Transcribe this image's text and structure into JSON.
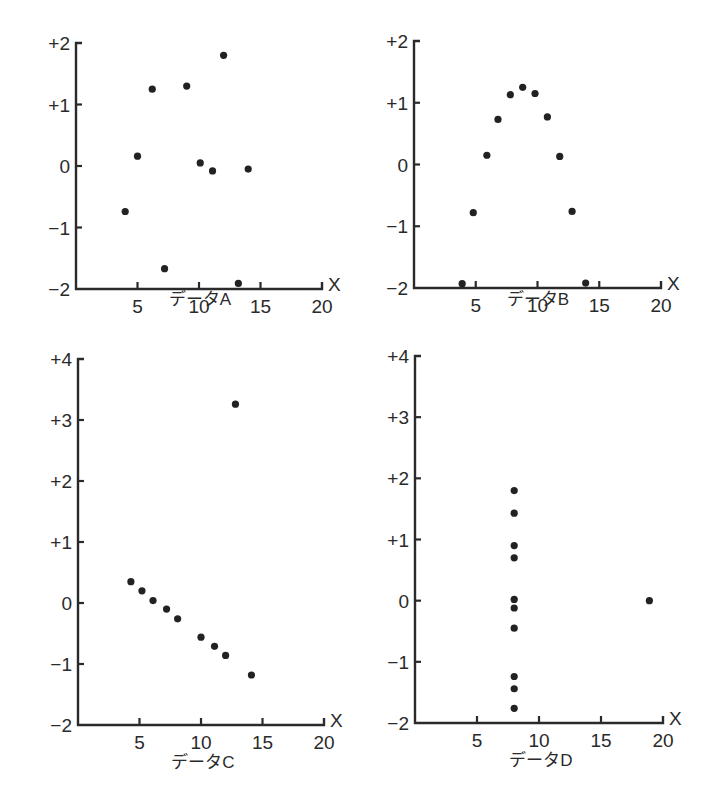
{
  "chart_data": [
    {
      "type": "scatter",
      "title": "データA",
      "xlabel": "X",
      "ylabel": "",
      "xlim": [
        0,
        20
      ],
      "ylim": [
        -2,
        2
      ],
      "xticks": [
        "5",
        "10",
        "15",
        "20"
      ],
      "yticks": [
        "-2",
        "-1",
        "0",
        "+1",
        "+2"
      ],
      "grid": false,
      "points": [
        {
          "x": 4,
          "y": -0.74
        },
        {
          "x": 5,
          "y": 0.16
        },
        {
          "x": 6.2,
          "y": 1.25
        },
        {
          "x": 7.2,
          "y": -1.67
        },
        {
          "x": 9,
          "y": 1.3
        },
        {
          "x": 10.1,
          "y": 0.05
        },
        {
          "x": 11.1,
          "y": -0.08
        },
        {
          "x": 12,
          "y": 1.8
        },
        {
          "x": 13.2,
          "y": -1.91
        },
        {
          "x": 14,
          "y": -0.05
        }
      ]
    },
    {
      "type": "scatter",
      "title": "データB",
      "xlabel": "X",
      "ylabel": "",
      "xlim": [
        0,
        20
      ],
      "ylim": [
        -2,
        2
      ],
      "xticks": [
        "5",
        "10",
        "15",
        "20"
      ],
      "yticks": [
        "-2",
        "-1",
        "0",
        "+1",
        "+2"
      ],
      "grid": false,
      "points": [
        {
          "x": 3.9,
          "y": -1.93
        },
        {
          "x": 4.8,
          "y": -0.78
        },
        {
          "x": 5.9,
          "y": 0.15
        },
        {
          "x": 6.8,
          "y": 0.73
        },
        {
          "x": 7.8,
          "y": 1.13
        },
        {
          "x": 8.8,
          "y": 1.25
        },
        {
          "x": 9.8,
          "y": 1.15
        },
        {
          "x": 10.8,
          "y": 0.77
        },
        {
          "x": 11.8,
          "y": 0.13
        },
        {
          "x": 12.8,
          "y": -0.76
        },
        {
          "x": 13.9,
          "y": -1.92
        }
      ]
    },
    {
      "type": "scatter",
      "title": "データC",
      "xlabel": "X",
      "ylabel": "",
      "xlim": [
        0,
        20
      ],
      "ylim": [
        -2,
        4
      ],
      "xticks": [
        "5",
        "10",
        "15",
        "20"
      ],
      "yticks": [
        "-2",
        "-1",
        "0",
        "+1",
        "+2",
        "+3",
        "+4"
      ],
      "grid": false,
      "points": [
        {
          "x": 4.3,
          "y": 0.35
        },
        {
          "x": 5.2,
          "y": 0.2
        },
        {
          "x": 6.1,
          "y": 0.04
        },
        {
          "x": 7.2,
          "y": -0.1
        },
        {
          "x": 8.1,
          "y": -0.26
        },
        {
          "x": 10,
          "y": -0.56
        },
        {
          "x": 11.1,
          "y": -0.71
        },
        {
          "x": 12,
          "y": -0.86
        },
        {
          "x": 12.8,
          "y": 3.26
        },
        {
          "x": 14.1,
          "y": -1.18
        }
      ]
    },
    {
      "type": "scatter",
      "title": "データD",
      "xlabel": "X",
      "ylabel": "",
      "xlim": [
        0,
        20
      ],
      "ylim": [
        -2,
        4
      ],
      "xticks": [
        "5",
        "10",
        "15",
        "20"
      ],
      "yticks": [
        "-2",
        "-1",
        "0",
        "+1",
        "+2",
        "+3",
        "+4"
      ],
      "grid": false,
      "points": [
        {
          "x": 8,
          "y": 1.8
        },
        {
          "x": 8,
          "y": 1.43
        },
        {
          "x": 8,
          "y": 0.9
        },
        {
          "x": 8,
          "y": 0.7
        },
        {
          "x": 8,
          "y": 0.02
        },
        {
          "x": 8,
          "y": -0.12
        },
        {
          "x": 8,
          "y": -0.45
        },
        {
          "x": 8,
          "y": -1.24
        },
        {
          "x": 8,
          "y": -1.44
        },
        {
          "x": 8,
          "y": -1.76
        },
        {
          "x": 18.9,
          "y": 0
        }
      ]
    }
  ],
  "panels": [
    {
      "caption": "データA",
      "x_axis_label": "X"
    },
    {
      "caption": "データB",
      "x_axis_label": "X"
    },
    {
      "caption": "データC",
      "x_axis_label": "X"
    },
    {
      "caption": "データD",
      "x_axis_label": "X"
    }
  ]
}
